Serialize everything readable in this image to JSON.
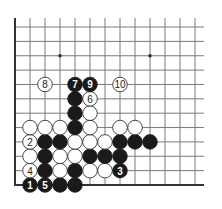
{
  "diagram": {
    "type": "go-board-fragment",
    "corner": "bottom-left",
    "columns": 13,
    "rows": 12,
    "star_points": [
      {
        "col": 3,
        "line": 9
      },
      {
        "col": 9,
        "line": 9
      }
    ],
    "stones": [
      {
        "color": "black",
        "col": 1,
        "line": 0,
        "label": "1"
      },
      {
        "color": "black",
        "col": 2,
        "line": 0,
        "label": "5"
      },
      {
        "color": "black",
        "col": 3,
        "line": 0,
        "label": ""
      },
      {
        "color": "black",
        "col": 4,
        "line": 0,
        "label": ""
      },
      {
        "color": "white",
        "col": 1,
        "line": 1,
        "label": "4"
      },
      {
        "color": "black",
        "col": 2,
        "line": 1,
        "label": ""
      },
      {
        "color": "white",
        "col": 3,
        "line": 1,
        "label": ""
      },
      {
        "color": "black",
        "col": 4,
        "line": 1,
        "label": ""
      },
      {
        "color": "white",
        "col": 5,
        "line": 1,
        "label": ""
      },
      {
        "color": "white",
        "col": 6,
        "line": 1,
        "label": ""
      },
      {
        "color": "black",
        "col": 7,
        "line": 1,
        "label": "3"
      },
      {
        "color": "white",
        "col": 1,
        "line": 2,
        "label": ""
      },
      {
        "color": "black",
        "col": 2,
        "line": 2,
        "label": ""
      },
      {
        "color": "white",
        "col": 3,
        "line": 2,
        "label": ""
      },
      {
        "color": "white",
        "col": 4,
        "line": 2,
        "label": ""
      },
      {
        "color": "black",
        "col": 5,
        "line": 2,
        "label": ""
      },
      {
        "color": "black",
        "col": 6,
        "line": 2,
        "label": ""
      },
      {
        "color": "black",
        "col": 7,
        "line": 2,
        "label": ""
      },
      {
        "color": "white",
        "col": 1,
        "line": 3,
        "label": "2"
      },
      {
        "color": "black",
        "col": 2,
        "line": 3,
        "label": ""
      },
      {
        "color": "black",
        "col": 3,
        "line": 3,
        "label": ""
      },
      {
        "color": "white",
        "col": 4,
        "line": 3,
        "label": ""
      },
      {
        "color": "white",
        "col": 5,
        "line": 3,
        "label": ""
      },
      {
        "color": "white",
        "col": 6,
        "line": 3,
        "label": ""
      },
      {
        "color": "black",
        "col": 7,
        "line": 3,
        "label": ""
      },
      {
        "color": "black",
        "col": 8,
        "line": 3,
        "label": ""
      },
      {
        "color": "black",
        "col": 9,
        "line": 3,
        "label": ""
      },
      {
        "color": "white",
        "col": 1,
        "line": 4,
        "label": ""
      },
      {
        "color": "white",
        "col": 2,
        "line": 4,
        "label": ""
      },
      {
        "color": "white",
        "col": 3,
        "line": 4,
        "label": ""
      },
      {
        "color": "black",
        "col": 4,
        "line": 4,
        "label": ""
      },
      {
        "color": "white",
        "col": 5,
        "line": 4,
        "label": ""
      },
      {
        "color": "white",
        "col": 7,
        "line": 4,
        "label": ""
      },
      {
        "color": "white",
        "col": 8,
        "line": 4,
        "label": ""
      },
      {
        "color": "black",
        "col": 4,
        "line": 5,
        "label": ""
      },
      {
        "color": "white",
        "col": 5,
        "line": 5,
        "label": ""
      },
      {
        "color": "black",
        "col": 4,
        "line": 6,
        "label": ""
      },
      {
        "color": "white",
        "col": 5,
        "line": 6,
        "label": "6"
      },
      {
        "color": "white",
        "col": 2,
        "line": 7,
        "label": "8"
      },
      {
        "color": "black",
        "col": 4,
        "line": 7,
        "label": "7"
      },
      {
        "color": "black",
        "col": 5,
        "line": 7,
        "label": "9"
      },
      {
        "color": "white",
        "col": 7,
        "line": 7,
        "label": "10"
      }
    ]
  },
  "colors": {
    "background": "#ffffff",
    "grid": "#7a7a7a",
    "edge": "#333333",
    "black_stone": "#1a1a1a",
    "white_stone": "#ffffff"
  }
}
